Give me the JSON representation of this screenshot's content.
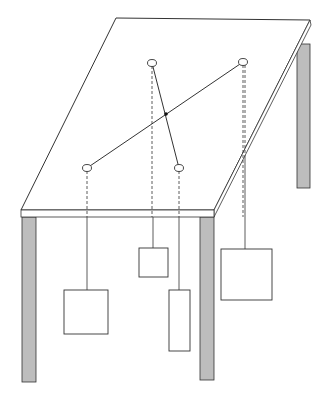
{
  "diagram": {
    "colors": {
      "stroke": "#333333",
      "leg_fill": "#bdbdbd",
      "background": "#ffffff",
      "pivot": "#111111"
    },
    "table": {
      "top_quad": [
        [
          116,
          18
        ],
        [
          310,
          20
        ],
        [
          214,
          210
        ],
        [
          21,
          210
        ]
      ],
      "slab": {
        "x": 21,
        "y": 210,
        "w": 193,
        "h": 7
      },
      "legs": [
        {
          "name": "front-left",
          "x": 22,
          "y": 217,
          "w": 14,
          "h": 165
        },
        {
          "name": "front-right",
          "x": 200,
          "y": 217,
          "w": 14,
          "h": 163
        },
        {
          "name": "back-right",
          "x": 297,
          "y": 44,
          "w": 13,
          "h": 144
        }
      ]
    },
    "rods": [
      {
        "from": [
          152,
          63
        ],
        "to": [
          179,
          168
        ]
      },
      {
        "from": [
          243,
          62
        ],
        "to": [
          87,
          168
        ]
      }
    ],
    "pivot": [
      166,
      114
    ],
    "anchors": [
      {
        "name": "a",
        "cx": 152,
        "cy": 63
      },
      {
        "name": "b",
        "cx": 243,
        "cy": 62
      },
      {
        "name": "c",
        "cx": 87,
        "cy": 168
      },
      {
        "name": "d",
        "cx": 179,
        "cy": 168
      }
    ],
    "weights": [
      {
        "name": "weight-c",
        "anchor_x": 87,
        "x": 64,
        "y": 290,
        "w": 44,
        "h": 44
      },
      {
        "name": "weight-a",
        "anchor_x": 153,
        "x": 139,
        "y": 248,
        "w": 29,
        "h": 29
      },
      {
        "name": "weight-d",
        "anchor_x": 179,
        "x": 169,
        "y": 290,
        "w": 21,
        "h": 61
      },
      {
        "name": "weight-b",
        "anchor_x": 245,
        "x": 221,
        "y": 249,
        "w": 51,
        "h": 51
      }
    ]
  }
}
